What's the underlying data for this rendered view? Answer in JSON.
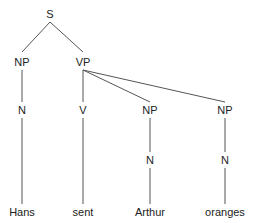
{
  "tree": {
    "nodes": {
      "S": {
        "label": "S"
      },
      "NP1": {
        "label": "NP"
      },
      "VP": {
        "label": "VP"
      },
      "N1": {
        "label": "N"
      },
      "V": {
        "label": "V"
      },
      "NP2": {
        "label": "NP"
      },
      "NP3": {
        "label": "NP"
      },
      "N2": {
        "label": "N"
      },
      "N3": {
        "label": "N"
      },
      "W1": {
        "label": "Hans"
      },
      "W2": {
        "label": "sent"
      },
      "W3": {
        "label": "Arthur"
      },
      "W4": {
        "label": "oranges"
      }
    },
    "edges": [
      [
        "S",
        "NP1"
      ],
      [
        "S",
        "VP"
      ],
      [
        "NP1",
        "N1"
      ],
      [
        "N1",
        "W1"
      ],
      [
        "VP",
        "V"
      ],
      [
        "VP",
        "NP2"
      ],
      [
        "VP",
        "NP3"
      ],
      [
        "V",
        "W2"
      ],
      [
        "NP2",
        "N2"
      ],
      [
        "N2",
        "W3"
      ],
      [
        "NP3",
        "N3"
      ],
      [
        "N3",
        "W4"
      ]
    ]
  }
}
